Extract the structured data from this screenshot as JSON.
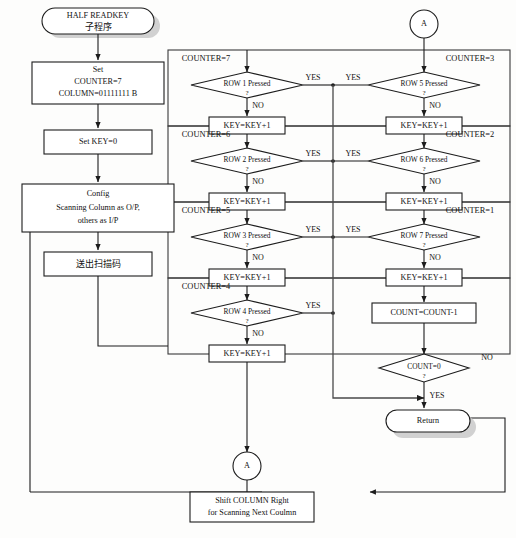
{
  "diagram": {
    "colors": {
      "stroke": "#1c1c1c",
      "fill": "#ffffff",
      "shadow": "#c9c9c9",
      "frame": "#3a3a3a"
    }
  },
  "start": {
    "line1": "HALF READKEY",
    "line2": "子程序"
  },
  "left_column": {
    "set_init": {
      "line1": "Set",
      "line2": "COUNTER=7",
      "line3": "COLUMN=01111111 B"
    },
    "set_key": {
      "label": "Set KEY=0"
    },
    "config": {
      "line1": "Config",
      "line2": "Scanning Column as O/P,",
      "line3": "others as I/P"
    },
    "send_scan": {
      "label": "送出扫描码"
    }
  },
  "sections": [
    {
      "counter": "COUNTER=7",
      "decision": "ROW 1 Pressed",
      "q": "?",
      "no": "NO",
      "yes": "YES",
      "increment": "KEY=KEY+1"
    },
    {
      "counter": "COUNTER=6",
      "decision": "ROW 2 Pressed",
      "q": "?",
      "no": "NO",
      "yes": "YES",
      "increment": "KEY=KEY+1"
    },
    {
      "counter": "COUNTER=5",
      "decision": "ROW 3 Pressed",
      "q": "?",
      "no": "NO",
      "yes": "YES",
      "increment": "KEY=KEY+1"
    },
    {
      "counter": "COUNTER=4",
      "decision": "ROW 4 Pressed",
      "q": "?",
      "no": "NO",
      "yes": "YES",
      "increment": "KEY=KEY+1"
    }
  ],
  "sections_right": [
    {
      "counter": "COUNTER=3",
      "decision": "ROW 5 Pressed",
      "q": "?",
      "no": "NO",
      "yes": "YES",
      "increment": "KEY=KEY+1"
    },
    {
      "counter": "COUNTER=2",
      "decision": "ROW 6 Pressed",
      "q": "?",
      "no": "NO",
      "yes": "YES",
      "increment": "KEY=KEY+1"
    },
    {
      "counter": "COUNTER=1",
      "decision": "ROW 7 Pressed",
      "q": "?",
      "no": "NO",
      "yes": "YES",
      "increment": "KEY=KEY+1"
    }
  ],
  "count_dec": {
    "label": "COUNT=COUNT-1"
  },
  "count_zero": {
    "label": "COUNT=0",
    "q": "?",
    "yes": "YES",
    "no": "NO"
  },
  "return_node": {
    "label": "Return"
  },
  "connector_top_right": {
    "label": "A"
  },
  "connector_bottom": {
    "label": "A"
  },
  "shift_column": {
    "line1": "Shift COLUMN Right",
    "line2": "for Scanning Next Coulmn"
  }
}
